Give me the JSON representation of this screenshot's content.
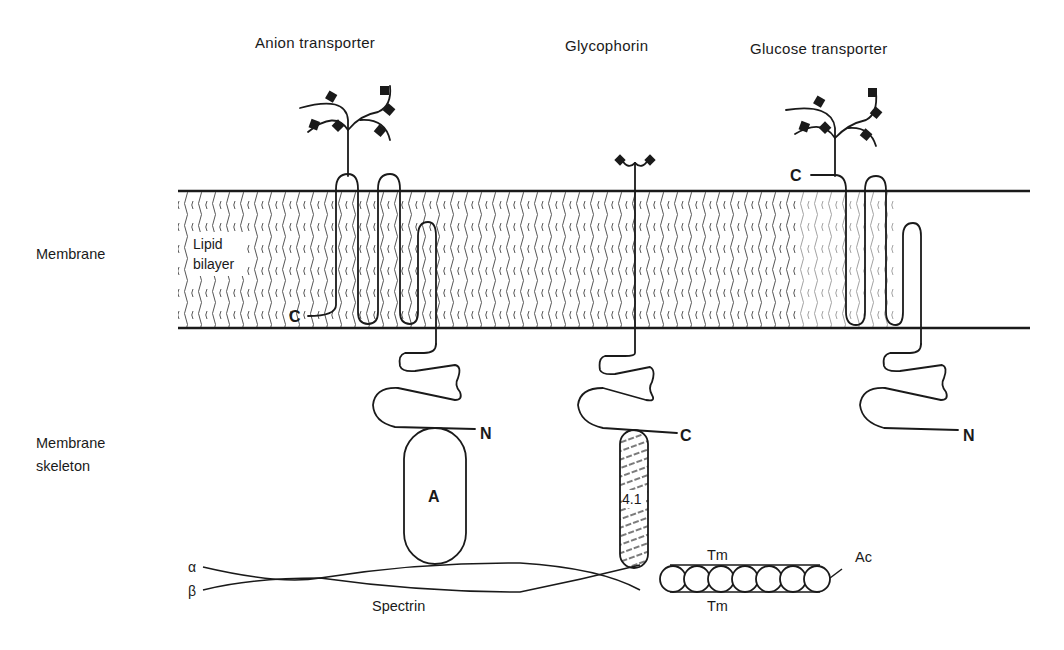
{
  "diagram": {
    "proteins": [
      {
        "id": "anion",
        "label": "Anion transporter"
      },
      {
        "id": "glycophorin",
        "label": "Glycophorin"
      },
      {
        "id": "glucose",
        "label": "Glucose transporter"
      }
    ],
    "regions": {
      "membrane": "Membrane",
      "lipid_bilayer_line1": "Lipid",
      "lipid_bilayer_line2": "bilayer",
      "skeleton_line1": "Membrane",
      "skeleton_line2": "skeleton"
    },
    "termini": {
      "anion_c": "C",
      "anion_n": "N",
      "glycophorin_c": "C",
      "glucose_c": "C",
      "glucose_n": "N"
    },
    "skeleton": {
      "ankyrin": "A",
      "band41": "4.1",
      "spectrin": "Spectrin",
      "alpha": "α",
      "beta": "β",
      "tropomyosin_top": "Tm",
      "tropomyosin_bottom": "Tm",
      "actin": "Ac",
      "actin_subunits": 7
    },
    "colors": {
      "ink": "#1a1a1a",
      "background": "#ffffff"
    }
  }
}
